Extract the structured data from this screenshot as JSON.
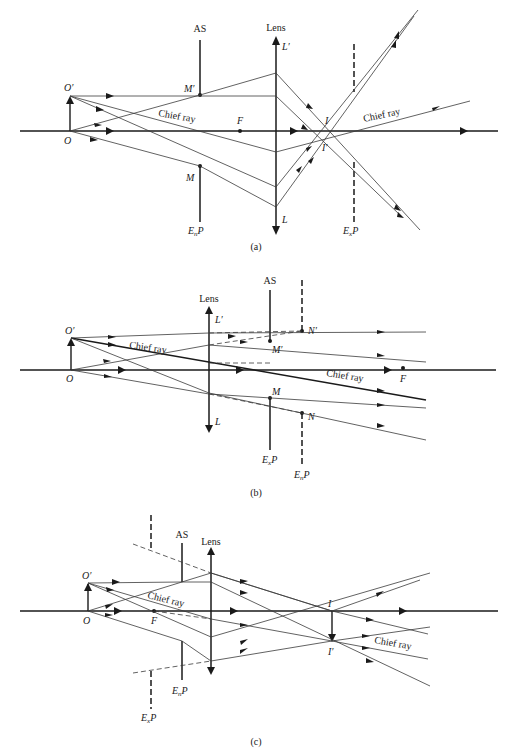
{
  "figure": {
    "panels": [
      {
        "id": "a",
        "caption": "(a)",
        "labels": {
          "aperture_stop": "AS",
          "lens": "Lens",
          "object_top": "O′",
          "object_base": "O",
          "marginal_top": "M′",
          "marginal_bottom": "M",
          "focal_point": "F",
          "lens_top": "L′",
          "lens_bottom": "L",
          "image_top": "I",
          "image_bottom": "I′",
          "chief_ray_left": "Chief ray",
          "chief_ray_right": "Chief ray",
          "entrance_pupil": "EnP",
          "exit_pupil": "ExP"
        }
      },
      {
        "id": "b",
        "caption": "(b)",
        "labels": {
          "aperture_stop": "AS",
          "lens": "Lens",
          "object_top": "O′",
          "object_base": "O",
          "lens_top": "L′",
          "lens_bottom": "L",
          "marginal_top": "M′",
          "marginal_bottom": "M",
          "pupil_top": "N′",
          "pupil_bottom": "N",
          "focal_point": "F",
          "chief_ray": "Chief ray",
          "exit_pupil": "ExP",
          "entrance_pupil": "EnP"
        }
      },
      {
        "id": "c",
        "caption": "(c)",
        "labels": {
          "aperture_stop": "AS",
          "lens": "Lens",
          "object_top": "O′",
          "object_base": "O",
          "focal_point": "F",
          "image_top": "I",
          "image_bottom": "I′",
          "chief_ray_left": "Chief ray",
          "chief_ray_right": "Chief ray",
          "entrance_pupil": "EnP",
          "exit_pupil": "ExP"
        }
      }
    ]
  }
}
